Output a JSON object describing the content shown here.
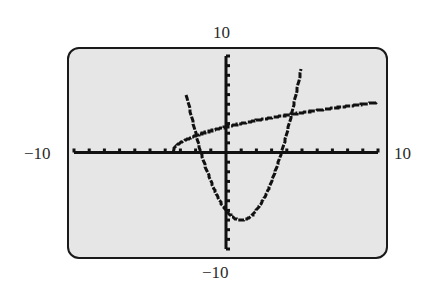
{
  "window": {
    "xmin": "-10",
    "xmax": "10",
    "ymin": "-10",
    "ymax": "10"
  },
  "colors": {
    "screen_bg": "#e6e6e6",
    "ink": "#111111",
    "frame": "#1a1a1a"
  },
  "chart_data": {
    "type": "line",
    "title": "",
    "xlabel": "",
    "ylabel": "",
    "xlim": [
      -10,
      10
    ],
    "ylim": [
      -10,
      10
    ],
    "xscale_ticks": 1,
    "yscale_ticks": 1,
    "grid": false,
    "tick_labels": {
      "left": "-10",
      "right": "10",
      "top": "10",
      "bottom": "-10"
    },
    "series": [
      {
        "name": "parabola",
        "expression": "y = x^2 - 2x - 6",
        "x": [
          -2.4,
          -2,
          -1.65,
          -1,
          0,
          1,
          2,
          3,
          3.65,
          4,
          4.9
        ],
        "values": [
          4.56,
          2,
          0,
          -3,
          -6,
          -7,
          -6,
          -3,
          0,
          2,
          8.2
        ]
      },
      {
        "name": "radical curve",
        "expression": "y = sqrt(2x + 7)",
        "x": [
          -3.5,
          -3,
          -2,
          -1,
          0,
          2,
          4.3,
          6,
          8,
          10
        ],
        "values": [
          0,
          1,
          1.73,
          2.24,
          2.65,
          3.32,
          3.99,
          4.36,
          4.8,
          5.2
        ]
      }
    ],
    "intersections": [
      {
        "x": -2.1,
        "y": 1.6
      },
      {
        "x": 4.3,
        "y": 4.0
      }
    ]
  }
}
